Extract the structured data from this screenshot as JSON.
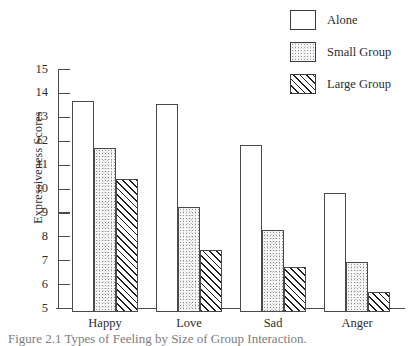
{
  "chart_data": {
    "type": "bar",
    "title": "",
    "xlabel": "",
    "ylabel": "Expressiveness Scores",
    "ylim": [
      5,
      15
    ],
    "yticks": [
      15,
      14,
      13,
      12,
      11,
      10,
      9,
      8,
      7,
      6,
      5
    ],
    "grid": false,
    "legend_position": "top-right",
    "categories": [
      "Happy",
      "Love",
      "Sad",
      "Anger"
    ],
    "series": [
      {
        "name": "Alone",
        "pattern": "empty",
        "values": [
          13.85,
          13.7,
          12.0,
          10.0
        ]
      },
      {
        "name": "Small Group",
        "pattern": "stipple",
        "values": [
          11.85,
          9.4,
          8.45,
          7.1
        ]
      },
      {
        "name": "Large Group",
        "pattern": "hatch",
        "values": [
          10.55,
          7.6,
          6.9,
          5.85
        ]
      }
    ]
  },
  "legend": {
    "items": [
      {
        "label": "Alone",
        "swatch": "empty-swatch-icon"
      },
      {
        "label": "Small Group",
        "swatch": "stipple-swatch-icon"
      },
      {
        "label": "Large Group",
        "swatch": "hatch-swatch-icon"
      }
    ]
  },
  "caption": {
    "text": "Figure 2.1  Types of Feeling by Size of Group Interaction."
  }
}
